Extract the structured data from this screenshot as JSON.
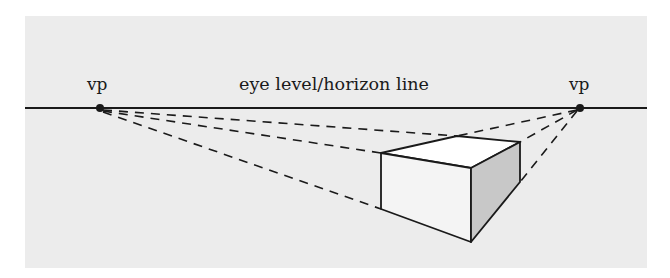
{
  "diagram": {
    "horizon_label": "eye level/horizon line",
    "vanishing_points": [
      {
        "label": "vp",
        "x": 100,
        "y": 108
      },
      {
        "label": "vp",
        "x": 580,
        "y": 108
      }
    ],
    "colors": {
      "background": "#ececec",
      "ink": "#1a1a1a",
      "box_top": "#ffffff",
      "box_front": "#f4f4f4",
      "box_side": "#c8c8c8"
    }
  }
}
